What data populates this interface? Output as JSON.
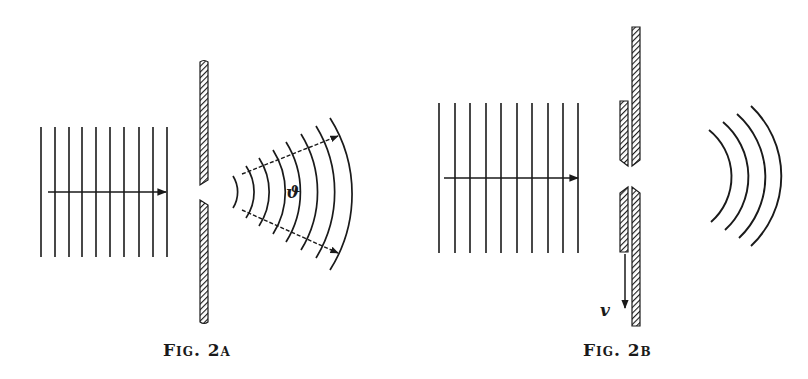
{
  "figures": [
    {
      "id": "fig-2a",
      "caption": "Fig. 2a",
      "description": "Plane wave passing through a fixed slit, producing diffracted circular wavefronts spreading at angle theta",
      "angle_label": "ϑ",
      "plane_wave_line_count": 10,
      "diffracted_wavefront_count": 8
    },
    {
      "id": "fig-2b",
      "caption": "Fig. 2b",
      "description": "Plane wave passing through a slit with a moving shutter, producing circular wavefronts",
      "velocity_label": "v",
      "plane_wave_line_count": 10,
      "diffracted_wavefront_count": 4
    }
  ],
  "colors": {
    "ink": "#1a1a1a",
    "background": "#ffffff"
  }
}
